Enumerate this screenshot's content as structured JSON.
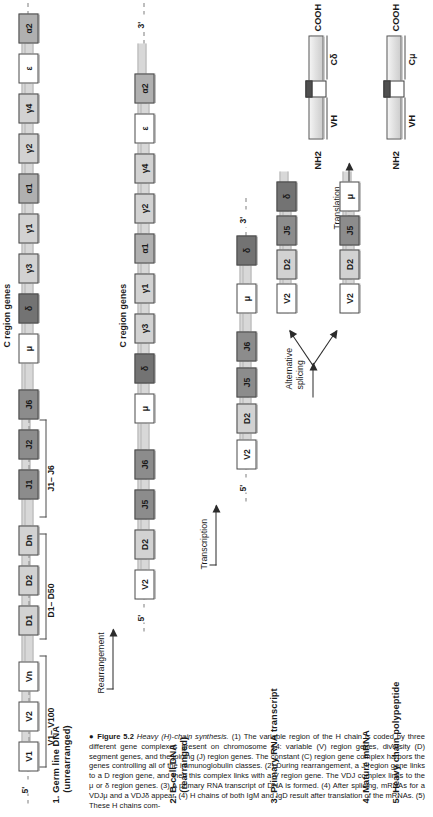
{
  "figure": {
    "bullet": "●",
    "number": "Figure 5.2",
    "title": "Heavy (H)-chain synthesis.",
    "caption_body": "(1) The variable region of the H chain is coded by three different gene complexes present on chromosome 14: variable (V) region genes, diversity (D) segment genes, and the joining (J) region genes. The constant (C) region gene complex harbors the genes controlling all of the immunoglobulin classes. (2) During rearrangement, a J region gene links to a D region gene, and then this complex links with a V region gene. The VDJ complex links to the μ or δ region genes. (3) A primary RNA transcript of DNA is formed. (4) After splicing, mRNAs for a VDJμ and a VDJδ appear. (4) H chains of both IgM and IgD result after translation of the mRNAs. (5) These H chains com-"
  },
  "steps": [
    {
      "id": 1,
      "label": "1. Germ line DNA\n    (unrearranged)"
    },
    {
      "id": 2,
      "label": "2. B-cell DNA\n    (rearranged)"
    },
    {
      "id": 3,
      "label": "3. Primary RNA transcript"
    },
    {
      "id": 4,
      "label": "4. Mature mRNA"
    },
    {
      "id": 5,
      "label": "5. Heavy chain polypeptide"
    }
  ],
  "arrows": [
    {
      "id": "rearrangement",
      "label": "Rearrangement"
    },
    {
      "id": "transcription",
      "label": "Transcription"
    },
    {
      "id": "splicing",
      "label": "Alternative\nsplicing"
    },
    {
      "id": "translation",
      "label": "Translation"
    }
  ],
  "group_captions": {
    "c_region_row1": "C region genes",
    "c_region_row2": "C region genes"
  },
  "brackets": [
    {
      "id": "v-range",
      "label": "V1– V100"
    },
    {
      "id": "d-range",
      "label": "D1– D50"
    },
    {
      "id": "j-range",
      "label": "J1– J6"
    }
  ],
  "prime_markers": {
    "five": "5'",
    "three": "3'"
  },
  "rows": {
    "germline": {
      "name": "germ-line-dna",
      "segments": [
        {
          "label": "V1",
          "shade": "w-white"
        },
        {
          "label": "V2",
          "shade": "w-white"
        },
        {
          "label": "Vn",
          "shade": "w-white"
        },
        {
          "label": "D1",
          "shade": "w-lt"
        },
        {
          "label": "D2",
          "shade": "w-lt"
        },
        {
          "label": "Dn",
          "shade": "w-lt"
        },
        {
          "label": "J1",
          "shade": "w-dk"
        },
        {
          "label": "J2",
          "shade": "w-dk"
        },
        {
          "label": "J6",
          "shade": "w-dk"
        },
        {
          "label": "μ",
          "shade": "w-white"
        },
        {
          "label": "δ",
          "shade": "w-vdk"
        },
        {
          "label": "γ3",
          "shade": "w-lt"
        },
        {
          "label": "γ1",
          "shade": "w-lt"
        },
        {
          "label": "α1",
          "shade": "w-md"
        },
        {
          "label": "γ2",
          "shade": "w-lt"
        },
        {
          "label": "γ4",
          "shade": "w-lt"
        },
        {
          "label": "ε",
          "shade": "w-white"
        },
        {
          "label": "α2",
          "shade": "w-md"
        }
      ]
    },
    "bcell": {
      "name": "b-cell-dna",
      "segments": [
        {
          "label": "V2",
          "shade": "w-white"
        },
        {
          "label": "D2",
          "shade": "w-lt"
        },
        {
          "label": "J5",
          "shade": "w-dk"
        },
        {
          "label": "J6",
          "shade": "w-dk"
        },
        {
          "label": "μ",
          "shade": "w-white"
        },
        {
          "label": "δ",
          "shade": "w-vdk"
        },
        {
          "label": "γ3",
          "shade": "w-lt"
        },
        {
          "label": "γ1",
          "shade": "w-lt"
        },
        {
          "label": "α1",
          "shade": "w-md"
        },
        {
          "label": "γ2",
          "shade": "w-lt"
        },
        {
          "label": "γ4",
          "shade": "w-lt"
        },
        {
          "label": "ε",
          "shade": "w-white"
        },
        {
          "label": "α2",
          "shade": "w-md"
        }
      ]
    },
    "primary_rna": {
      "name": "primary-rna-transcript",
      "segments": [
        {
          "label": "V2",
          "shade": "w-white"
        },
        {
          "label": "D2",
          "shade": "w-lt"
        },
        {
          "label": "J5",
          "shade": "w-dk"
        },
        {
          "label": "J6",
          "shade": "w-dk"
        },
        {
          "label": "μ",
          "shade": "w-white"
        },
        {
          "label": "δ",
          "shade": "w-vdk"
        }
      ]
    },
    "mrna_delta": {
      "name": "mature-mrna-delta",
      "segments": [
        {
          "label": "V2",
          "shade": "w-white"
        },
        {
          "label": "D2",
          "shade": "w-lt"
        },
        {
          "label": "J5",
          "shade": "w-dk"
        },
        {
          "label": "δ",
          "shade": "w-vdk"
        }
      ]
    },
    "mrna_mu": {
      "name": "mature-mrna-mu",
      "segments": [
        {
          "label": "V2",
          "shade": "w-white"
        },
        {
          "label": "D2",
          "shade": "w-lt"
        },
        {
          "label": "J5",
          "shade": "w-dk"
        },
        {
          "label": "μ",
          "shade": "w-white"
        }
      ]
    }
  },
  "polypeptides": {
    "delta_chain": {
      "name": "heavy-chain-delta",
      "n_term": "NH2",
      "c_term": "COOH",
      "domains": [
        {
          "label": "VH"
        },
        {
          "label": "Cδ"
        }
      ]
    },
    "mu_chain": {
      "name": "heavy-chain-mu",
      "n_term": "NH2",
      "c_term": "COOH",
      "domains": [
        {
          "label": "VH"
        },
        {
          "label": "Cμ"
        }
      ]
    }
  },
  "colors": {
    "box_white": "#ffffff",
    "box_light": "#d2d2d2",
    "box_medium": "#b0b0b0",
    "box_dark": "#8c8c8c",
    "box_very_dark": "#737373",
    "backbone": "#d8d8d8",
    "ink": "#1a1a1a"
  }
}
